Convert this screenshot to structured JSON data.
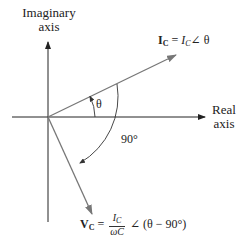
{
  "diagram": {
    "type": "phasor-diagram",
    "axes": {
      "vertical_label_line1": "Imaginary",
      "vertical_label_line2": "axis",
      "horizontal_label_line1": "Real",
      "horizontal_label_line2": "axis"
    },
    "current_phasor": {
      "symbol": "I",
      "subscript": "C",
      "equals": "=",
      "magnitude_symbol": "I",
      "magnitude_subscript": "C",
      "angle_symbol": "∠",
      "angle": "θ"
    },
    "voltage_phasor": {
      "symbol": "V",
      "subscript": "C",
      "equals": "=",
      "numerator_symbol": "I",
      "numerator_subscript": "C",
      "denominator": "ωC",
      "angle_symbol": "∠",
      "angle": "(θ − 90°)"
    },
    "angles": {
      "theta_label": "θ",
      "quadrature_label": "90°"
    },
    "colors": {
      "axes": "#222222",
      "phasors": "#777777",
      "arcs": "#333333",
      "text": "#222222"
    }
  }
}
